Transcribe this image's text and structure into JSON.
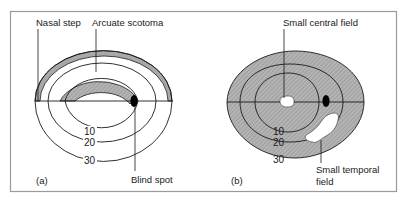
{
  "figure": {
    "panels": [
      {
        "id": "a",
        "tag": "(a)",
        "labels": {
          "nasal_step": "Nasal step",
          "arcuate_scotoma": "Arcuate scotoma",
          "blind_spot": "Blind spot"
        },
        "isopters": [
          "10",
          "20",
          "30"
        ]
      },
      {
        "id": "b",
        "tag": "(b)",
        "labels": {
          "small_central_field": "Small central field",
          "small_temporal_field_line1": "Small temporal",
          "small_temporal_field_line2": "field"
        },
        "isopters": [
          "10",
          "20",
          "30"
        ]
      }
    ],
    "colors": {
      "frame": "#9a9a9a",
      "line": "#1a1a1a",
      "scotoma_fill": "#a8a8a8",
      "hatch": "#7a7a7a",
      "blind_spot": "#000000"
    }
  }
}
